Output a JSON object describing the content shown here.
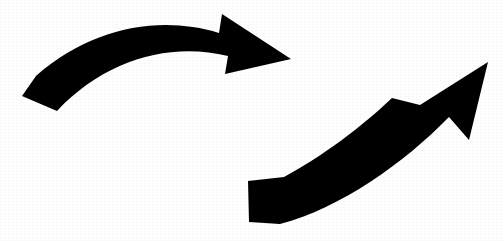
{
  "image": {
    "title": "Two curved arrows forming a cycle",
    "description": "Black clip-art style graphic of two thick curved arrows: an upper arrow sweeping left-to-right pointing right, and a lower arrow sweeping left-to-right pointing up-right.",
    "width": 504,
    "height": 241,
    "background_color": "#ffffff",
    "ink_color": "#000000",
    "shape_count": 2
  },
  "shapes": {
    "upper_arrow": {
      "name": "upper-curved-arrow",
      "direction": "right",
      "tail_position": "left",
      "head_position": "upper-center",
      "tail_point": [
        22,
        96
      ],
      "tip_point": [
        291,
        59
      ],
      "color": "#000000",
      "path": "M 22 96 L 36 76 C 92 27 160 15 219 33 L 222 14 L 291 59 L 225 74 L 228 56 C 170 42 106 59 57 111 Z"
    },
    "lower_arrow": {
      "name": "lower-curved-arrow",
      "direction": "up-right",
      "tail_position": "lower-center",
      "head_position": "right",
      "tail_point": [
        248,
        181
      ],
      "tip_point": [
        488,
        62
      ],
      "color": "#000000",
      "path": "M 248 181 L 284 177 C 312 162 353 135 392 98 L 420 105 L 488 62 L 469 140 L 449 117 C 404 163 341 208 280 224 L 249 222 Z"
    }
  }
}
